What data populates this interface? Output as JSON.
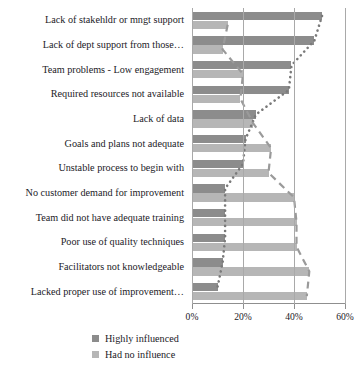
{
  "chart_data": {
    "type": "bar",
    "orientation": "horizontal",
    "title": "",
    "subtitle": "",
    "xlabel": "",
    "ylabel": "",
    "xlim": [
      0,
      60
    ],
    "xticks": [
      0,
      20,
      40,
      60
    ],
    "xtick_labels": [
      "0%",
      "20%",
      "40%",
      "60%"
    ],
    "grid": true,
    "grid_axis": "x",
    "legend_position": "bottom-left",
    "categories": [
      "Lack of stakehldr or mngt support",
      "Lack of dept support from those…",
      "Team problems - Low engagement",
      "Required resources not available",
      "Lack of data",
      "Goals and plans not adequate",
      "Unstable process to begin with",
      "No customer demand for improvement",
      "Team did not have adequate training",
      "Poor use of quality techniques",
      "Facilitators not knowledgeable",
      "Lacked proper use of improvement…"
    ],
    "series": [
      {
        "name": "Highly influenced",
        "color": "#8c8c8c",
        "values": [
          51,
          48,
          39,
          38,
          25,
          21,
          20,
          13,
          13,
          13,
          12,
          10
        ]
      },
      {
        "name": "Had no influence",
        "color": "#b6b6b6",
        "values": [
          14,
          12,
          20,
          19,
          24,
          31,
          30,
          40,
          41,
          41,
          46,
          45
        ]
      }
    ],
    "trendlines": [
      {
        "name": "highly-influenced-trend",
        "style": "dotted",
        "color": "#7a7a7a",
        "tracks_series": "Highly influenced"
      },
      {
        "name": "had-no-influence-trend",
        "style": "dashed",
        "color": "#9a9a9a",
        "tracks_series": "Had no influence"
      }
    ]
  },
  "legend": {
    "items": [
      {
        "label": "Highly influenced",
        "swatch": "dark"
      },
      {
        "label": "Had no influence",
        "swatch": "light"
      }
    ]
  }
}
